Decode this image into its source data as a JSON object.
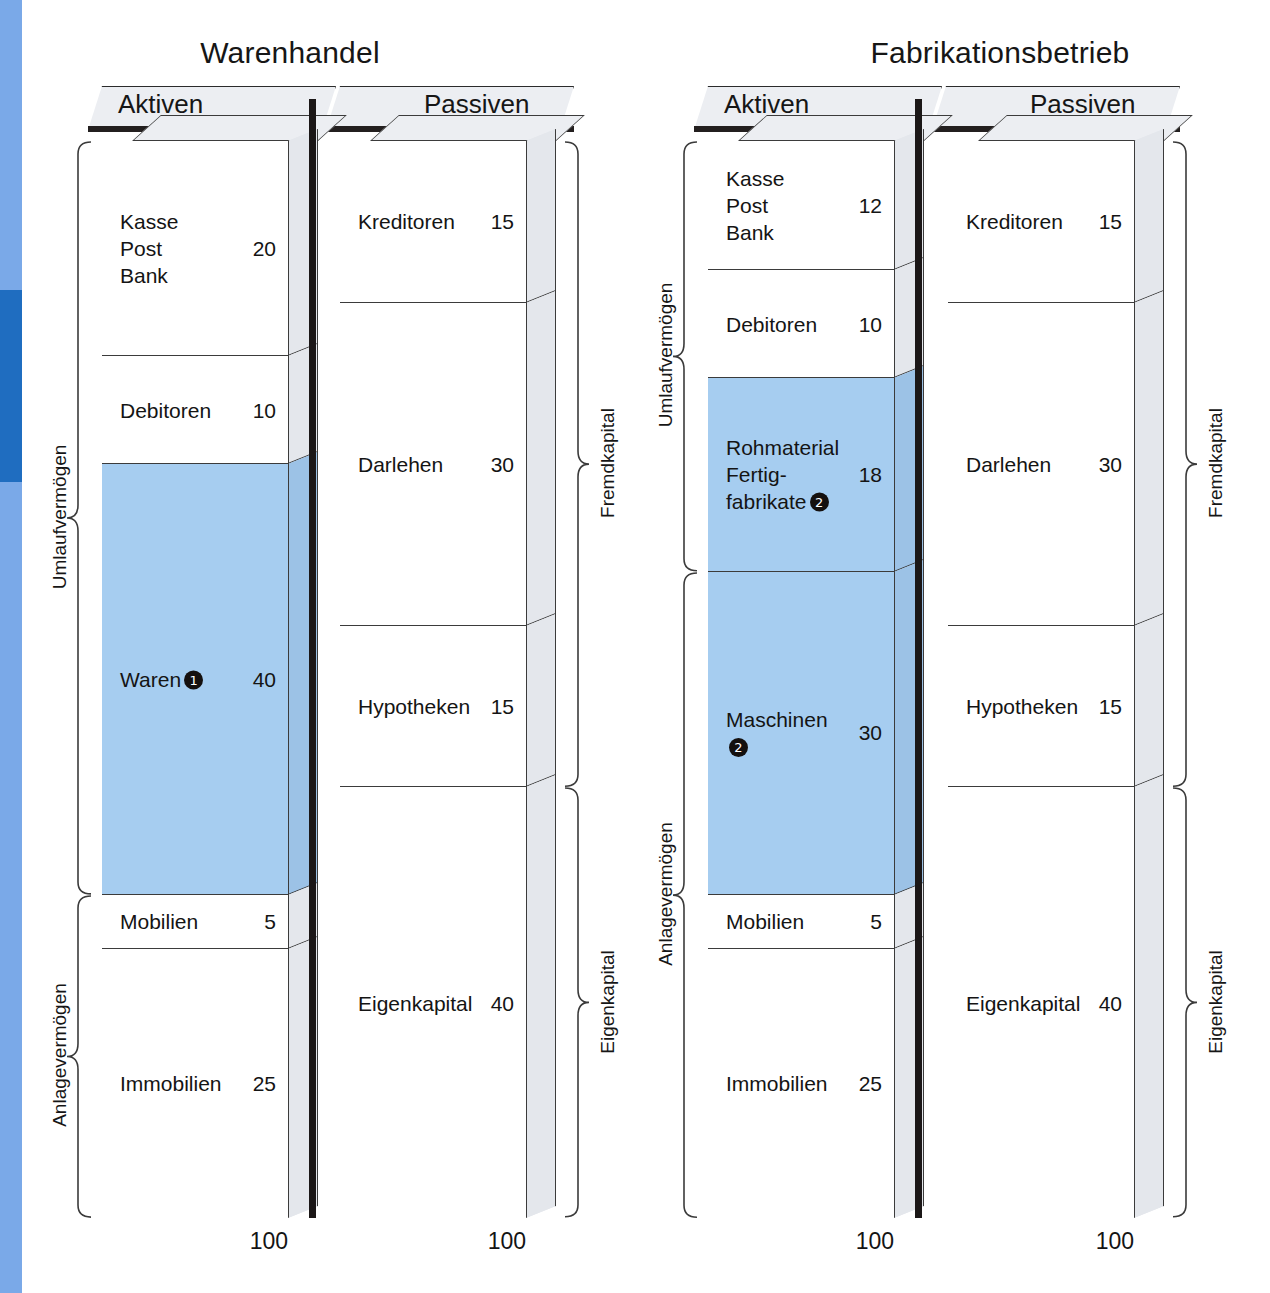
{
  "colors": {
    "band_light": "#7aa9e8",
    "band_dark": "#1f6dc0",
    "inventory_blue": "#a6cdf0",
    "side_panel": "#e4e7ec",
    "outline": "#3b3b3b"
  },
  "charts": [
    {
      "id": "warenhandel",
      "title": "Warenhandel",
      "aktiven_header": "Aktiven",
      "passiven_header": "Passiven",
      "aktiven_total": "100",
      "passiven_total": "100",
      "assets": [
        {
          "label": "Kasse\nPost\nBank",
          "value": "20",
          "units": 20,
          "blue": false,
          "footnote": ""
        },
        {
          "label": "Debitoren",
          "value": "10",
          "units": 10,
          "blue": false,
          "footnote": ""
        },
        {
          "label": "Waren",
          "value": "40",
          "units": 40,
          "blue": true,
          "footnote": "1"
        },
        {
          "label": "Mobilien",
          "value": "5",
          "units": 5,
          "blue": false,
          "footnote": ""
        },
        {
          "label": "Immobilien",
          "value": "25",
          "units": 25,
          "blue": false,
          "footnote": ""
        }
      ],
      "liabilities": [
        {
          "label": "Kreditoren",
          "value": "15",
          "units": 15
        },
        {
          "label": "Darlehen",
          "value": "30",
          "units": 30
        },
        {
          "label": "Hypotheken",
          "value": "15",
          "units": 15
        },
        {
          "label": "Eigenkapital",
          "value": "40",
          "units": 40
        }
      ],
      "asset_groups": [
        {
          "label": "Umlaufvermögen",
          "units": 70
        },
        {
          "label": "Anlagevermögen",
          "units": 30
        }
      ],
      "liability_groups": [
        {
          "label": "Fremdkapital",
          "units": 60
        },
        {
          "label": "Eigenkapital",
          "units": 40
        }
      ]
    },
    {
      "id": "fabrikation",
      "title": "Fabrikationsbetrieb",
      "aktiven_header": "Aktiven",
      "passiven_header": "Passiven",
      "aktiven_total": "100",
      "passiven_total": "100",
      "assets": [
        {
          "label": "Kasse\nPost\nBank",
          "value": "12",
          "units": 12,
          "blue": false,
          "footnote": ""
        },
        {
          "label": "Debitoren",
          "value": "10",
          "units": 10,
          "blue": false,
          "footnote": ""
        },
        {
          "label": "Rohmaterial\nFertig-\nfabrikate",
          "value": "18",
          "units": 18,
          "blue": true,
          "footnote": "2"
        },
        {
          "label": "Maschinen",
          "value": "30",
          "units": 30,
          "blue": true,
          "footnote": "2"
        },
        {
          "label": "Mobilien",
          "value": "5",
          "units": 5,
          "blue": false,
          "footnote": ""
        },
        {
          "label": "Immobilien",
          "value": "25",
          "units": 25,
          "blue": false,
          "footnote": ""
        }
      ],
      "liabilities": [
        {
          "label": "Kreditoren",
          "value": "15",
          "units": 15
        },
        {
          "label": "Darlehen",
          "value": "30",
          "units": 30
        },
        {
          "label": "Hypotheken",
          "value": "15",
          "units": 15
        },
        {
          "label": "Eigenkapital",
          "value": "40",
          "units": 40
        }
      ],
      "asset_groups": [
        {
          "label": "Umlaufvermögen",
          "units": 40
        },
        {
          "label": "Anlagevermögen",
          "units": 60
        }
      ],
      "liability_groups": [
        {
          "label": "Fremdkapital",
          "units": 60
        },
        {
          "label": "Eigenkapital",
          "units": 40
        }
      ]
    }
  ],
  "chart_data": {
    "type": "bar",
    "xlabel": "",
    "ylabel": "",
    "ylim": [
      0,
      100
    ],
    "grid": false,
    "legend": "none",
    "panels": [
      {
        "name": "Warenhandel",
        "columns": [
          {
            "name": "Aktiven",
            "total": 100,
            "categories": [
              "Kasse Post Bank",
              "Debitoren",
              "Waren",
              "Mobilien",
              "Immobilien"
            ],
            "values": [
              20,
              10,
              40,
              5,
              25
            ],
            "highlighted": [
              "Waren"
            ],
            "groups": [
              {
                "name": "Umlaufvermögen",
                "value": 70,
                "members": [
                  "Kasse Post Bank",
                  "Debitoren",
                  "Waren"
                ]
              },
              {
                "name": "Anlagevermögen",
                "value": 30,
                "members": [
                  "Mobilien",
                  "Immobilien"
                ]
              }
            ]
          },
          {
            "name": "Passiven",
            "total": 100,
            "categories": [
              "Kreditoren",
              "Darlehen",
              "Hypotheken",
              "Eigenkapital"
            ],
            "values": [
              15,
              30,
              15,
              40
            ],
            "groups": [
              {
                "name": "Fremdkapital",
                "value": 60,
                "members": [
                  "Kreditoren",
                  "Darlehen",
                  "Hypotheken"
                ]
              },
              {
                "name": "Eigenkapital",
                "value": 40,
                "members": [
                  "Eigenkapital"
                ]
              }
            ]
          }
        ]
      },
      {
        "name": "Fabrikationsbetrieb",
        "columns": [
          {
            "name": "Aktiven",
            "total": 100,
            "categories": [
              "Kasse Post Bank",
              "Debitoren",
              "Rohmaterial Fertigfabrikate",
              "Maschinen",
              "Mobilien",
              "Immobilien"
            ],
            "values": [
              12,
              10,
              18,
              30,
              5,
              25
            ],
            "highlighted": [
              "Rohmaterial Fertigfabrikate",
              "Maschinen"
            ],
            "groups": [
              {
                "name": "Umlaufvermögen",
                "value": 40,
                "members": [
                  "Kasse Post Bank",
                  "Debitoren",
                  "Rohmaterial Fertigfabrikate"
                ]
              },
              {
                "name": "Anlagevermögen",
                "value": 60,
                "members": [
                  "Maschinen",
                  "Mobilien",
                  "Immobilien"
                ]
              }
            ]
          },
          {
            "name": "Passiven",
            "total": 100,
            "categories": [
              "Kreditoren",
              "Darlehen",
              "Hypotheken",
              "Eigenkapital"
            ],
            "values": [
              15,
              30,
              15,
              40
            ],
            "groups": [
              {
                "name": "Fremdkapital",
                "value": 60,
                "members": [
                  "Kreditoren",
                  "Darlehen",
                  "Hypotheken"
                ]
              },
              {
                "name": "Eigenkapital",
                "value": 40,
                "members": [
                  "Eigenkapital"
                ]
              }
            ]
          }
        ]
      }
    ],
    "footnotes": {
      "1": "Waren",
      "2": "Rohmaterial / Fertigfabrikate / Maschinen"
    }
  }
}
